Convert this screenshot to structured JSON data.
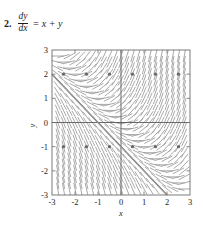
{
  "problem": {
    "number": "2.",
    "equation": {
      "numerator": "dy",
      "denominator": "dx",
      "rhs": "= x + y"
    }
  },
  "chart_data": {
    "type": "scatter",
    "subtype": "slope-field",
    "title": "",
    "xlabel": "x",
    "ylabel": "y",
    "xlim": [
      -3,
      3
    ],
    "ylim": [
      -3,
      3
    ],
    "xticks": [
      -3,
      -2,
      -1,
      0,
      1,
      2,
      3
    ],
    "yticks": [
      -3,
      -2,
      -1,
      0,
      1,
      2,
      3
    ],
    "xtick_labels": [
      "-3",
      "-2",
      "-1",
      "0",
      "1",
      "2",
      "3"
    ],
    "ytick_labels": [
      "-3",
      "-2",
      "-1",
      "0",
      "1",
      "2",
      "3"
    ],
    "grid": false,
    "equation": "dy/dx = x + y",
    "slope_field": {
      "description": "Short line segments with slope x + y drawn on a grid",
      "x_start": -2.75,
      "x_end": 2.75,
      "x_step": 0.25,
      "y_start": -2.75,
      "y_end": 2.75,
      "y_step": 0.25,
      "segment_length": 0.2,
      "color": "#9a9a9a"
    },
    "solution_curve": {
      "name": "y = -x - 1",
      "slope": -1,
      "intercept": -1,
      "x_from": -3,
      "x_to": 2,
      "color": "#7a7a7a"
    },
    "marked_points": {
      "description": "Dark dots marking sampled points on two rows",
      "color": "#6a6a6a",
      "rows": [
        {
          "y": 2,
          "x_values": [
            -2.5,
            -1.5,
            -0.5,
            0.5,
            1.5,
            2.5
          ]
        },
        {
          "y": -1,
          "x_values": [
            -2.5,
            -1.5,
            -0.5,
            0.5,
            1.5,
            2.5
          ]
        }
      ]
    },
    "axis_title_x": "x",
    "axis_title_y": "y"
  }
}
